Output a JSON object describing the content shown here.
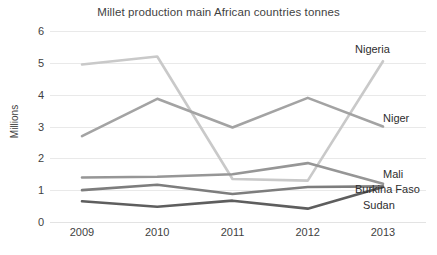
{
  "chart_data": {
    "type": "line",
    "title": "Millet production main African countries tonnes",
    "xlabel": "",
    "ylabel": "Millions",
    "categories": [
      "2009",
      "2010",
      "2011",
      "2012",
      "2013"
    ],
    "x": [
      2009,
      2010,
      2011,
      2012,
      2013
    ],
    "ylim": [
      0,
      6
    ],
    "yticks": [
      0,
      1,
      2,
      3,
      4,
      5,
      6
    ],
    "grid": true,
    "legend_position": "right-inline-labels",
    "series": [
      {
        "name": "Nigeria",
        "values": [
          4.95,
          5.2,
          1.35,
          1.3,
          5.05
        ],
        "color": "#c9c9c9"
      },
      {
        "name": "Niger",
        "values": [
          2.7,
          3.87,
          2.97,
          3.9,
          3.0
        ],
        "color": "#a3a3a3"
      },
      {
        "name": "Mali",
        "values": [
          1.4,
          1.42,
          1.5,
          1.85,
          1.2
        ],
        "color": "#969696"
      },
      {
        "name": "Burkina Faso",
        "values": [
          1.0,
          1.17,
          0.88,
          1.1,
          1.12
        ],
        "color": "#7d7d7d"
      },
      {
        "name": "Sudan",
        "values": [
          0.65,
          0.48,
          0.67,
          0.42,
          1.1
        ],
        "color": "#5e5e5e"
      }
    ]
  },
  "axis": {
    "y_tick_labels": [
      "6",
      "5",
      "4",
      "3",
      "2",
      "1",
      "0"
    ],
    "y_axis_title": "Millions",
    "x_tick_labels": [
      "2009",
      "2010",
      "2011",
      "2012",
      "2013"
    ]
  },
  "series_labels": [
    {
      "text": "Nigeria",
      "left": 355,
      "top": 43
    },
    {
      "text": "Niger",
      "left": 383,
      "top": 112
    },
    {
      "text": "Mali",
      "left": 383,
      "top": 168
    },
    {
      "text": "Burkina Faso",
      "left": 355,
      "top": 183
    },
    {
      "text": "Sudan",
      "left": 363,
      "top": 199
    }
  ],
  "colors": {
    "background": "#ffffff",
    "grid": "#e9e9e9",
    "text": "#3a3a3a"
  }
}
